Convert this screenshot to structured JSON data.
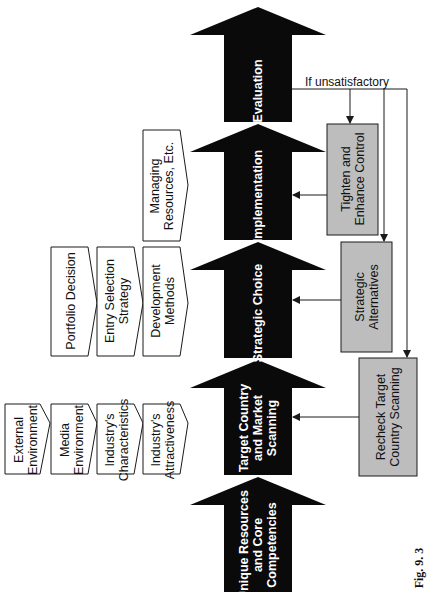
{
  "figure_label": "Fig. 9. 3",
  "colors": {
    "arrow_fill": "#0a0a0a",
    "arrow_text": "#ffffff",
    "gray_box_fill": "#bdbdbd",
    "outline": "#1a1a1a",
    "background": "#ffffff"
  },
  "main_flow": [
    {
      "id": "unique-resources",
      "label": "Unique Resources and Core Competencies"
    },
    {
      "id": "target-country",
      "label": "Target Country and Market Scanning"
    },
    {
      "id": "strategic-choice",
      "label": "Strategic Choice"
    },
    {
      "id": "implementation",
      "label": "Implementation"
    },
    {
      "id": "evaluation",
      "label": "Evaluation"
    }
  ],
  "feedback": {
    "condition_label": "If unsatisfactory",
    "boxes": [
      {
        "id": "tighten-control",
        "label": "Tighten and Enhance Control",
        "targets": "implementation"
      },
      {
        "id": "strategic-alternatives",
        "label": "Strategic Alternatives",
        "targets": "strategic-choice"
      },
      {
        "id": "recheck-target",
        "label": "Recheck Target Country Scanning",
        "targets": "target-country"
      }
    ]
  },
  "inputs": {
    "target_country": [
      {
        "label": "External Environment"
      },
      {
        "label": "Media Environment"
      },
      {
        "label": "Industry's Characteristics"
      },
      {
        "label": "Industry's Attractiveness"
      }
    ],
    "strategic_choice": [
      {
        "label": "Portfolio Decision"
      },
      {
        "label": "Entry Selection Strategy"
      },
      {
        "label": "Development Methods"
      }
    ],
    "implementation": [
      {
        "label": "Managing Resources, Etc."
      }
    ]
  }
}
